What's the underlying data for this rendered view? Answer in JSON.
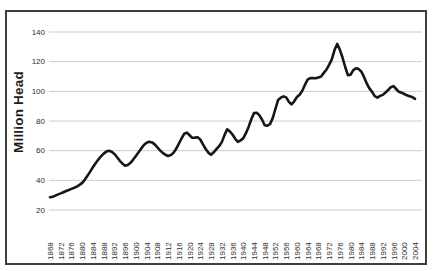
{
  "chart_data": {
    "type": "line",
    "title": "",
    "y_axis_title": "Million Head",
    "xlabel": "",
    "ylabel": "Million Head",
    "x_range": [
      1868,
      2004
    ],
    "ylim": [
      20,
      140
    ],
    "y_ticks": [
      20,
      40,
      60,
      80,
      100,
      120,
      140
    ],
    "x_tick_labels": [
      "1868",
      "1872",
      "1876",
      "1880",
      "1884",
      "1888",
      "1892",
      "1896",
      "1900",
      "1904",
      "1908",
      "1912",
      "1916",
      "1920",
      "1924",
      "1928",
      "1932",
      "1936",
      "1940",
      "1944",
      "1948",
      "1952",
      "1956",
      "1960",
      "1964",
      "1968",
      "1972",
      "1976",
      "1980",
      "1984",
      "1988",
      "1992",
      "1996",
      "2000",
      "2004"
    ],
    "grid": "horizontal-on",
    "legend": "none",
    "line_color": "#161616",
    "grid_color": "#cccccc",
    "frame_color": "#3f3f3f",
    "series": [
      {
        "x_start": 1868,
        "x_step": 1,
        "values": [
          28.6,
          29.0,
          29.7,
          30.5,
          31.2,
          32.0,
          32.8,
          33.5,
          34.2,
          35.0,
          35.8,
          36.9,
          38.3,
          40.5,
          43.2,
          46.0,
          48.8,
          51.5,
          54.0,
          56.2,
          58.0,
          59.4,
          60.0,
          59.3,
          57.8,
          55.6,
          53.2,
          51.2,
          49.8,
          50.3,
          51.8,
          54.0,
          56.5,
          59.0,
          61.5,
          63.8,
          65.4,
          66.0,
          65.6,
          64.2,
          62.2,
          60.2,
          58.5,
          57.2,
          56.4,
          57.0,
          58.6,
          61.2,
          64.6,
          68.2,
          71.4,
          72.2,
          70.4,
          68.7,
          68.8,
          69.0,
          67.5,
          64.2,
          61.1,
          58.7,
          57.3,
          58.9,
          61.0,
          63.0,
          65.8,
          70.3,
          74.4,
          73.0,
          70.9,
          68.0,
          66.0,
          66.9,
          68.3,
          71.8,
          76.0,
          81.2,
          85.3,
          85.6,
          84.0,
          81.0,
          77.2,
          76.8,
          78.0,
          82.1,
          88.1,
          94.2,
          95.7,
          96.6,
          95.9,
          92.9,
          91.2,
          93.3,
          96.2,
          97.7,
          100.4,
          104.5,
          107.9,
          109.0,
          108.9,
          108.8,
          109.4,
          110.0,
          112.4,
          114.6,
          117.9,
          121.5,
          127.8,
          132.0,
          128.0,
          122.8,
          116.4,
          110.9,
          111.2,
          114.3,
          115.6,
          115.0,
          113.4,
          109.7,
          105.4,
          102.0,
          99.6,
          96.7,
          95.8,
          96.9,
          97.6,
          99.2,
          100.9,
          102.8,
          103.5,
          101.6,
          99.7,
          99.1,
          98.2,
          97.3,
          96.7,
          96.1,
          94.9
        ]
      }
    ]
  }
}
